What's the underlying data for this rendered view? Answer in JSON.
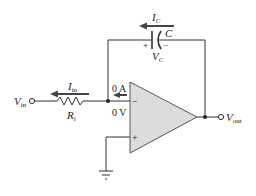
{
  "diagram": {
    "type": "op-amp integrator circuit",
    "colors": {
      "wire": "#333333",
      "opamp_fill": "#dcdcdc",
      "text": "#222222"
    },
    "labels": {
      "vin_main": "V",
      "vin_sub": "in",
      "vout_main": "V",
      "vout_sub": "out",
      "iin_main": "I",
      "iin_sub": "in",
      "ri_main": "R",
      "ri_sub": "i",
      "ic_main": "I",
      "ic_sub": "C",
      "cap_name": "C",
      "vc_main": "V",
      "vc_sub": "C",
      "cap_plus": "+",
      "cap_minus": "−",
      "current_at_node": "0 A",
      "voltage_at_node": "0 V",
      "opamp_minus": "−",
      "opamp_plus": "+"
    },
    "components": [
      {
        "name": "input-resistor",
        "label": "Ri"
      },
      {
        "name": "feedback-capacitor",
        "label": "C"
      },
      {
        "name": "op-amp",
        "label": ""
      },
      {
        "name": "ground",
        "label": ""
      }
    ]
  }
}
